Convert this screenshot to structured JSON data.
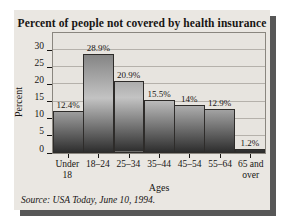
{
  "figure": {
    "title": "Percent of people not covered by health insurance",
    "source": "Source: USA Today, June 10, 1994."
  },
  "colors": {
    "page_bg": "#ffffff",
    "card_bg": "#eae7e2",
    "card_shadow": "#575757",
    "plot_bg": "#e7e4df",
    "plot_border": "#8a867f",
    "grid_line": "#b5b1ab",
    "bar_border": "#2e2c2a",
    "bar_gradient_top": "#646464",
    "bar_gradient_mid": "#c3c3c3",
    "bar_gradient_bottom": "#2d2d2d",
    "text": "#171513"
  },
  "chart_data": {
    "type": "bar",
    "title": "Percent of people not covered by health insurance",
    "categories": [
      "Under\n18",
      "18–24",
      "25–34",
      "35–44",
      "45–54",
      "55–64",
      "65 and\nover"
    ],
    "values": [
      12.4,
      28.9,
      20.9,
      15.5,
      14,
      12.9,
      1.2
    ],
    "value_labels": [
      "12.4%",
      "28.9%",
      "20.9%",
      "15.5%",
      "14%",
      "12.9%",
      "1.2%"
    ],
    "xlabel": "Ages",
    "ylabel": "Percent",
    "ylim": [
      0,
      35
    ],
    "yticks": [
      0,
      5,
      10,
      15,
      20,
      25,
      30
    ],
    "grid": true,
    "legend": "none",
    "bar_gap": 0,
    "source": "Source: USA Today, June 10, 1994."
  }
}
